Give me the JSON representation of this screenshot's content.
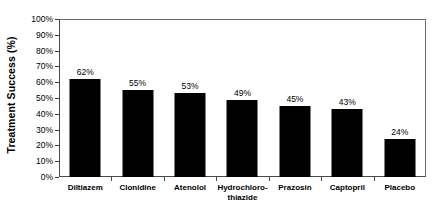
{
  "chart_data": {
    "type": "bar",
    "title": "",
    "subtitle": "",
    "xlabel": "",
    "ylabel": "Treatment Success (%)",
    "categories": [
      "Diltiazem",
      "Clonidine",
      "Atenolol",
      "Hydrochloro-thiazide",
      "Prazosin",
      "Captopril",
      "Placebo"
    ],
    "category_lines": [
      [
        "Diltiazem"
      ],
      [
        "Clonidine"
      ],
      [
        "Atenolol"
      ],
      [
        "Hydrochloro-",
        "thiazide"
      ],
      [
        "Prazosin"
      ],
      [
        "Captopril"
      ],
      [
        "Placebo"
      ]
    ],
    "values": [
      62,
      55,
      53,
      49,
      45,
      43,
      24
    ],
    "value_labels": [
      "62%",
      "55%",
      "53%",
      "49%",
      "45%",
      "43%",
      "24%"
    ],
    "ylim": [
      0,
      100
    ],
    "ytick_values": [
      100,
      90,
      80,
      70,
      60,
      50,
      40,
      30,
      20,
      10,
      0
    ],
    "ytick_labels": [
      "100%",
      "90%",
      "80%",
      "70%",
      "60%",
      "50%",
      "40%",
      "30%",
      "20%",
      "10%",
      "0%"
    ],
    "grid": false,
    "legend": null,
    "legend_position": "none",
    "bar_color": "#000000",
    "axis_color": "#4a4a4a",
    "background_color": "#ffffff"
  }
}
